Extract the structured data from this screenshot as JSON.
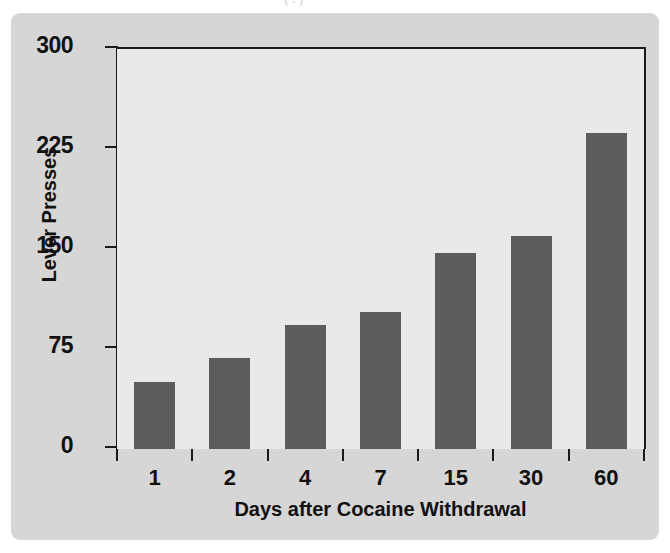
{
  "figure": {
    "caption_remnant": "( . )",
    "background_color": "#d6d6d6",
    "plot_background_color": "#e9e9e9",
    "bar_color": "#5c5c5c",
    "axis_color": "#1a1a1a"
  },
  "chart_data": {
    "type": "bar",
    "title": "",
    "xlabel": "Days after Cocaine Withdrawal",
    "ylabel": "Lever Presses",
    "categories": [
      "1",
      "2",
      "4",
      "7",
      "15",
      "30",
      "60"
    ],
    "values": [
      50,
      68,
      93,
      103,
      147,
      160,
      237
    ],
    "ylim": [
      0,
      300
    ],
    "yticks": [
      0,
      75,
      150,
      225,
      300
    ],
    "ytick_labels": [
      "0",
      "75",
      "150",
      "225",
      "300"
    ],
    "xtick_labels": [
      "1",
      "2",
      "4",
      "7",
      "15",
      "30",
      "60"
    ],
    "grid": false,
    "legend": "none",
    "series": [
      {
        "name": "Lever Presses",
        "values": [
          50,
          68,
          93,
          103,
          147,
          160,
          237
        ]
      }
    ]
  }
}
